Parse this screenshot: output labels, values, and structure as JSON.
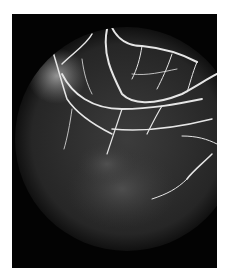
{
  "image": {
    "subject": "fluorescein angiography fundus image",
    "background_color": "#ffffff",
    "frame_color": "#030303",
    "vessel_color": "#e8e8e8"
  },
  "caption": ""
}
